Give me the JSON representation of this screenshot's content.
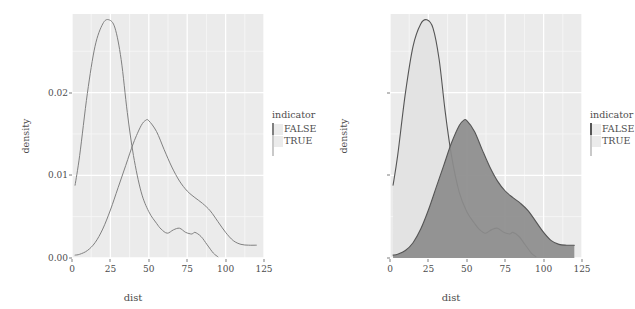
{
  "figure": {
    "panels": [
      {
        "id": "left",
        "style": "outline",
        "xlabel": "dist",
        "ylabel": "density",
        "legend_title": "indicator"
      },
      {
        "id": "right",
        "style": "filled",
        "xlabel": "dist",
        "ylabel": "density",
        "legend_title": "indicator"
      }
    ]
  },
  "colors": {
    "panel_background": "#ebebeb",
    "grid_major": "#ffffff",
    "grid_minor": "#f7f7f7",
    "line": "#808080",
    "line_dark": "#555555",
    "fill_false": "#8c8c8c",
    "fill_true": "#e3e3e3",
    "text": "#4d4d4d",
    "page_background": "#ffffff"
  },
  "chart_data": [
    {
      "type": "area",
      "title": "",
      "xlabel": "dist",
      "ylabel": "density",
      "xlim": [
        0,
        125
      ],
      "ylim": [
        0,
        0.0295
      ],
      "xticks": [
        0,
        25,
        50,
        75,
        100,
        125
      ],
      "xtick_labels": [
        "0",
        "25",
        "50",
        "75",
        "100",
        "125"
      ],
      "yticks": [
        0.0,
        0.01,
        0.02
      ],
      "ytick_labels": [
        "0.00",
        "0.01",
        "0.02"
      ],
      "grid": true,
      "legend_position": "right",
      "legend_title": "indicator",
      "fill": false,
      "series": [
        {
          "name": "FALSE",
          "x": [
            2,
            5,
            10,
            15,
            20,
            25,
            30,
            35,
            40,
            45,
            48,
            50,
            55,
            60,
            65,
            70,
            75,
            80,
            85,
            90,
            95,
            100,
            105,
            110,
            115,
            120
          ],
          "values": [
            0.00035,
            0.00045,
            0.0009,
            0.00185,
            0.0035,
            0.0058,
            0.0085,
            0.0112,
            0.0139,
            0.016,
            0.01665,
            0.0166,
            0.0153,
            0.0131,
            0.011,
            0.0093,
            0.0081,
            0.0073,
            0.0066,
            0.0057,
            0.0044,
            0.0031,
            0.0021,
            0.00165,
            0.00155,
            0.00155
          ]
        },
        {
          "name": "TRUE",
          "x": [
            2,
            5,
            10,
            15,
            20,
            24,
            28,
            32,
            36,
            40,
            45,
            50,
            55,
            58,
            62,
            66,
            70,
            74,
            78,
            80,
            84,
            88,
            92,
            95
          ],
          "values": [
            0.0088,
            0.0124,
            0.0199,
            0.0256,
            0.0283,
            0.0288,
            0.0278,
            0.024,
            0.0176,
            0.0124,
            0.008,
            0.0056,
            0.0042,
            0.0035,
            0.003,
            0.0034,
            0.0036,
            0.0031,
            0.0029,
            0.0031,
            0.0026,
            0.0016,
            0.0006,
            0.00015
          ]
        }
      ]
    },
    {
      "type": "area",
      "title": "",
      "xlabel": "dist",
      "ylabel": "density",
      "xlim": [
        0,
        125
      ],
      "ylim": [
        0,
        0.0295
      ],
      "xticks": [
        0,
        25,
        50,
        75,
        100,
        125
      ],
      "xtick_labels": [
        "0",
        "25",
        "50",
        "75",
        "100",
        "125"
      ],
      "yticks": [
        0.0,
        0.01,
        0.02
      ],
      "ytick_labels": [
        "0.00",
        "0.01",
        "0.02"
      ],
      "grid": true,
      "legend_position": "right",
      "legend_title": "indicator",
      "fill": true,
      "series": [
        {
          "name": "FALSE",
          "x": [
            2,
            5,
            10,
            15,
            20,
            25,
            30,
            35,
            40,
            45,
            48,
            50,
            55,
            60,
            65,
            70,
            75,
            80,
            85,
            90,
            95,
            100,
            105,
            110,
            115,
            120
          ],
          "values": [
            0.00035,
            0.00045,
            0.0009,
            0.00185,
            0.0035,
            0.0058,
            0.0085,
            0.0112,
            0.0139,
            0.016,
            0.01665,
            0.0166,
            0.0153,
            0.0131,
            0.011,
            0.0093,
            0.0081,
            0.0073,
            0.0066,
            0.0057,
            0.0044,
            0.0031,
            0.0021,
            0.00165,
            0.00155,
            0.00155
          ]
        },
        {
          "name": "TRUE",
          "x": [
            2,
            5,
            10,
            15,
            20,
            24,
            28,
            32,
            36,
            40,
            45,
            50,
            55,
            58,
            62,
            66,
            70,
            74,
            78,
            80,
            84,
            88,
            92,
            95
          ],
          "values": [
            0.0088,
            0.0124,
            0.0199,
            0.0256,
            0.0283,
            0.0288,
            0.0278,
            0.024,
            0.0176,
            0.0124,
            0.008,
            0.0056,
            0.0042,
            0.0035,
            0.003,
            0.0034,
            0.0036,
            0.0031,
            0.0029,
            0.0031,
            0.0026,
            0.0016,
            0.0006,
            0.00015
          ]
        }
      ]
    }
  ]
}
